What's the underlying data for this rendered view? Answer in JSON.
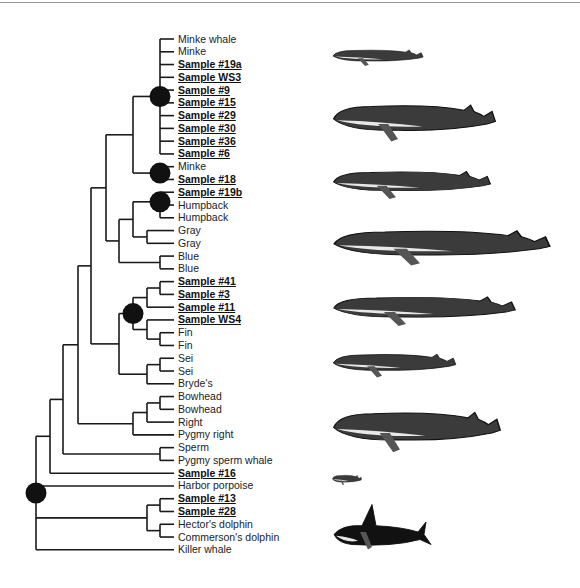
{
  "figure": {
    "title": "",
    "leaf_start_y": 39,
    "leaf_spacing": 12.77,
    "label_x": 156,
    "leaves": [
      {
        "label": "Minke whale",
        "sample": false
      },
      {
        "label": "Minke",
        "sample": false
      },
      {
        "label": "Sample #19a",
        "sample": true
      },
      {
        "label": "Sample WS3",
        "sample": true
      },
      {
        "label": "Sample #9",
        "sample": true
      },
      {
        "label": "Sample #15",
        "sample": true
      },
      {
        "label": "Sample #29",
        "sample": true
      },
      {
        "label": "Sample #30",
        "sample": true
      },
      {
        "label": "Sample #36",
        "sample": true
      },
      {
        "label": "Sample #6",
        "sample": true
      },
      {
        "label": "Minke",
        "sample": false
      },
      {
        "label": "Sample #18",
        "sample": true
      },
      {
        "label": "Sample #19b",
        "sample": true
      },
      {
        "label": "Humpback",
        "sample": false
      },
      {
        "label": "Humpback",
        "sample": false
      },
      {
        "label": "Gray",
        "sample": false
      },
      {
        "label": "Gray",
        "sample": false
      },
      {
        "label": "Blue",
        "sample": false
      },
      {
        "label": "Blue",
        "sample": false
      },
      {
        "label": "Sample #41",
        "sample": true
      },
      {
        "label": "Sample #3",
        "sample": true
      },
      {
        "label": "Sample #11",
        "sample": true
      },
      {
        "label": "Sample WS4",
        "sample": true
      },
      {
        "label": "Fin",
        "sample": false
      },
      {
        "label": "Fin",
        "sample": false
      },
      {
        "label": "Sei",
        "sample": false
      },
      {
        "label": "Sei",
        "sample": false
      },
      {
        "label": "Bryde's",
        "sample": false
      },
      {
        "label": "Bowhead",
        "sample": false
      },
      {
        "label": "Bowhead",
        "sample": false
      },
      {
        "label": "Right",
        "sample": false
      },
      {
        "label": "Pygmy right",
        "sample": false
      },
      {
        "label": "Sperm",
        "sample": false
      },
      {
        "label": "Pygmy sperm whale",
        "sample": false
      },
      {
        "label": "Sample #16",
        "sample": true
      },
      {
        "label": "Harbor porpoise",
        "sample": false
      },
      {
        "label": "Sample #13",
        "sample": true
      },
      {
        "label": "Sample #28",
        "sample": true
      },
      {
        "label": "Hector's dolphin",
        "sample": false
      },
      {
        "label": "Commerson's dolphin",
        "sample": false
      },
      {
        "label": "Killer whale",
        "sample": false
      }
    ],
    "tree": {
      "x": 36,
      "dot": true,
      "children": [
        {
          "x": 50,
          "children": [
            {
              "x": 63,
              "children": [
                {
                  "x": 78,
                  "children": [
                    {
                      "x": 91,
                      "children": [
                        {
                          "x": 106,
                          "children": [
                            {
                              "x": 133,
                              "children": [
                                {
                                  "x": 160,
                                  "dot": true,
                                  "children": [
                                    0,
                                    1,
                                    2,
                                    3,
                                    4,
                                    5,
                                    6,
                                    7,
                                    8,
                                    9
                                  ]
                                },
                                {
                                  "x": 160,
                                  "dot": true,
                                  "children": [
                                    10,
                                    11
                                  ]
                                }
                              ]
                            },
                            {
                              "x": 119,
                              "children": [
                                {
                                  "x": 133,
                                  "children": [
                                    {
                                      "x": 160,
                                      "dot": true,
                                      "children": [
                                        12,
                                        {
                                          "x": 160,
                                          "children": [
                                            13,
                                            14
                                          ]
                                        }
                                      ]
                                    },
                                    {
                                      "x": 147,
                                      "children": [
                                        15,
                                        16
                                      ]
                                    }
                                  ]
                                },
                                {
                                  "x": 160,
                                  "children": [
                                    17,
                                    18
                                  ]
                                }
                              ]
                            }
                          ]
                        },
                        {
                          "x": 119,
                          "children": [
                            {
                              "x": 133,
                              "dot": true,
                              "children": [
                                {
                                  "x": 147,
                                  "children": [
                                    {
                                      "x": 160,
                                      "children": [
                                        19,
                                        20
                                      ]
                                    },
                                    21
                                  ]
                                },
                                {
                                  "x": 147,
                                  "children": [
                                    22,
                                    {
                                      "x": 160,
                                      "children": [
                                        23,
                                        24
                                      ]
                                    }
                                  ]
                                }
                              ]
                            },
                            {
                              "x": 133,
                              "children": [
                                {
                                  "x": 147,
                                  "children": [
                                    {
                                      "x": 160,
                                      "children": [
                                        25,
                                        26
                                      ]
                                    },
                                    27
                                  ]
                                }
                              ]
                            }
                          ]
                        }
                      ]
                    },
                    {
                      "x": 133,
                      "children": [
                        {
                          "x": 147,
                          "children": [
                            {
                              "x": 160,
                              "children": [
                                28,
                                29
                              ]
                            },
                            30
                          ]
                        },
                        31
                      ]
                    }
                  ]
                },
                {
                  "x": 160,
                  "children": [
                    32,
                    33
                  ]
                }
              ]
            },
            34
          ]
        },
        35,
        {
          "x": 147,
          "children": [
            {
              "x": 160,
              "children": [
                36,
                37
              ]
            },
            {
              "x": 160,
              "children": [
                38,
                39
              ]
            }
          ]
        },
        40
      ]
    },
    "illustrations": [
      {
        "name": "minke-whale-illustration",
        "x": 332,
        "y": 45,
        "w": 92,
        "h": 22
      },
      {
        "name": "humpback-whale-illustration",
        "x": 332,
        "y": 94,
        "w": 165,
        "h": 50
      },
      {
        "name": "gray-whale-illustration",
        "x": 332,
        "y": 163,
        "w": 160,
        "h": 38
      },
      {
        "name": "blue-whale-illustration",
        "x": 332,
        "y": 220,
        "w": 220,
        "h": 48
      },
      {
        "name": "fin-whale-illustration",
        "x": 332,
        "y": 288,
        "w": 185,
        "h": 40
      },
      {
        "name": "sei-whale-illustration",
        "x": 332,
        "y": 347,
        "w": 125,
        "h": 32
      },
      {
        "name": "right-whale-illustration",
        "x": 332,
        "y": 400,
        "w": 170,
        "h": 55
      },
      {
        "name": "harbor-porpoise-illustration",
        "x": 332,
        "y": 472,
        "w": 30,
        "h": 14
      },
      {
        "name": "killer-whale-illustration",
        "x": 332,
        "y": 502,
        "w": 100,
        "h": 50
      }
    ],
    "colors": {
      "line": "#1a1a1a",
      "dot": "#111111",
      "text": "#222222"
    }
  }
}
